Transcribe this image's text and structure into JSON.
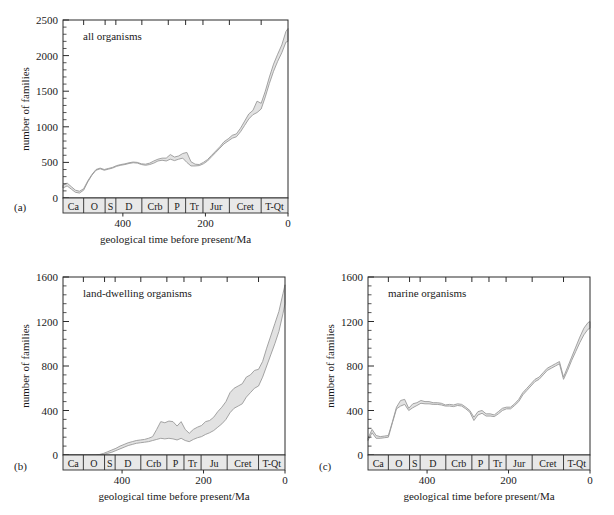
{
  "figure": {
    "axis_label_x": "geological time before present/Ma",
    "axis_label_y": "number of families",
    "panel_labels": {
      "a": "(a)",
      "b": "(b)",
      "c": "(c)"
    }
  },
  "chart_data": [
    {
      "id": "a",
      "type": "area",
      "title": "all organisms",
      "xlabel": "geological time before present/Ma",
      "ylabel": "number of families",
      "xlim": [
        545,
        0
      ],
      "ylim": [
        0,
        2500
      ],
      "xticks": [
        400,
        200,
        0
      ],
      "xtick_labels": [
        "400",
        "200",
        "0"
      ],
      "yticks": [
        0,
        500,
        1000,
        1500,
        2000,
        2500
      ],
      "ytick_labels": [
        "0",
        "500",
        "1000",
        "1500",
        "2000",
        "2500"
      ],
      "y_minor_step": 100,
      "grid": false,
      "legend": "none",
      "periods": [
        {
          "label": "Ca",
          "start": 545,
          "end": 495
        },
        {
          "label": "O",
          "start": 495,
          "end": 443
        },
        {
          "label": "S",
          "start": 443,
          "end": 417
        },
        {
          "label": "D",
          "start": 417,
          "end": 354
        },
        {
          "label": "Crb",
          "start": 354,
          "end": 290
        },
        {
          "label": "P",
          "start": 290,
          "end": 248
        },
        {
          "label": "Tr",
          "start": 248,
          "end": 206
        },
        {
          "label": "Jur",
          "start": 206,
          "end": 142
        },
        {
          "label": "Cret",
          "start": 142,
          "end": 65
        },
        {
          "label": "T-Qt",
          "start": 65,
          "end": 0
        }
      ],
      "x": [
        545,
        535,
        525,
        515,
        505,
        495,
        485,
        475,
        465,
        455,
        445,
        435,
        425,
        415,
        405,
        395,
        385,
        375,
        365,
        355,
        345,
        335,
        325,
        315,
        305,
        295,
        285,
        275,
        265,
        255,
        245,
        235,
        225,
        215,
        205,
        195,
        185,
        175,
        165,
        155,
        145,
        135,
        125,
        115,
        105,
        95,
        85,
        75,
        65,
        55,
        45,
        35,
        25,
        15,
        5,
        0
      ],
      "series": [
        {
          "name": "upper",
          "values": [
            180,
            210,
            160,
            110,
            95,
            130,
            240,
            330,
            400,
            420,
            400,
            415,
            430,
            455,
            470,
            480,
            495,
            505,
            500,
            480,
            475,
            490,
            520,
            545,
            560,
            560,
            610,
            575,
            590,
            625,
            640,
            510,
            475,
            470,
            500,
            540,
            600,
            660,
            720,
            790,
            830,
            880,
            900,
            980,
            1080,
            1180,
            1230,
            1360,
            1330,
            1500,
            1700,
            1880,
            2020,
            2150,
            2340,
            2380
          ]
        },
        {
          "name": "lower",
          "values": [
            140,
            170,
            125,
            80,
            70,
            110,
            225,
            320,
            390,
            410,
            390,
            405,
            420,
            445,
            460,
            470,
            485,
            495,
            490,
            470,
            460,
            470,
            490,
            520,
            530,
            520,
            545,
            525,
            545,
            560,
            500,
            450,
            450,
            455,
            480,
            520,
            580,
            640,
            700,
            760,
            800,
            840,
            860,
            930,
            1020,
            1110,
            1170,
            1200,
            1250,
            1420,
            1610,
            1780,
            1920,
            2040,
            2190,
            2200
          ]
        }
      ]
    },
    {
      "id": "b",
      "type": "area",
      "title": "land-dwelling organisms",
      "xlabel": "geological time before present/Ma",
      "ylabel": "number of families",
      "xlim": [
        545,
        0
      ],
      "ylim": [
        0,
        1600
      ],
      "xticks": [
        400,
        200,
        0
      ],
      "xtick_labels": [
        "400",
        "200",
        "0"
      ],
      "yticks": [
        0,
        400,
        800,
        1200,
        1600
      ],
      "ytick_labels": [
        "0",
        "400",
        "800",
        "1200",
        "1600"
      ],
      "y_minor_step": 80,
      "grid": false,
      "legend": "none",
      "periods": [
        {
          "label": "Ca",
          "start": 545,
          "end": 495
        },
        {
          "label": "O",
          "start": 495,
          "end": 443
        },
        {
          "label": "S",
          "start": 443,
          "end": 417
        },
        {
          "label": "D",
          "start": 417,
          "end": 354
        },
        {
          "label": "Crb",
          "start": 354,
          "end": 290
        },
        {
          "label": "P",
          "start": 290,
          "end": 248
        },
        {
          "label": "Tr",
          "start": 248,
          "end": 206
        },
        {
          "label": "Ju",
          "start": 206,
          "end": 142
        },
        {
          "label": "Cret",
          "start": 142,
          "end": 65
        },
        {
          "label": "T-Qt",
          "start": 65,
          "end": 0
        }
      ],
      "x": [
        545,
        535,
        525,
        515,
        505,
        495,
        485,
        475,
        465,
        455,
        445,
        435,
        425,
        415,
        405,
        395,
        385,
        375,
        365,
        355,
        345,
        335,
        325,
        315,
        305,
        295,
        285,
        275,
        265,
        255,
        245,
        235,
        225,
        215,
        205,
        195,
        185,
        175,
        165,
        155,
        145,
        135,
        125,
        115,
        105,
        95,
        85,
        75,
        65,
        55,
        45,
        35,
        25,
        15,
        5,
        0
      ],
      "series": [
        {
          "name": "upper",
          "values": [
            0,
            0,
            0,
            0,
            0,
            0,
            0,
            0,
            0,
            5,
            15,
            30,
            45,
            60,
            80,
            95,
            110,
            120,
            130,
            135,
            140,
            150,
            165,
            230,
            300,
            290,
            305,
            300,
            260,
            300,
            230,
            195,
            230,
            250,
            265,
            300,
            310,
            340,
            390,
            430,
            480,
            560,
            600,
            620,
            640,
            700,
            720,
            760,
            770,
            840,
            960,
            1070,
            1180,
            1290,
            1450,
            1530
          ]
        },
        {
          "name": "lower",
          "values": [
            0,
            0,
            0,
            0,
            0,
            0,
            0,
            0,
            0,
            0,
            5,
            15,
            25,
            40,
            55,
            70,
            85,
            95,
            105,
            110,
            115,
            120,
            130,
            140,
            150,
            145,
            150,
            145,
            135,
            150,
            130,
            120,
            140,
            155,
            165,
            185,
            200,
            220,
            250,
            280,
            320,
            380,
            420,
            440,
            460,
            520,
            560,
            600,
            620,
            700,
            800,
            900,
            1000,
            1110,
            1270,
            1360
          ]
        }
      ]
    },
    {
      "id": "c",
      "type": "area",
      "title": "marine organisms",
      "xlabel": "geological time before present/Ma",
      "ylabel": "number of families",
      "xlim": [
        545,
        0
      ],
      "ylim": [
        0,
        1600
      ],
      "xticks": [
        400,
        200,
        0
      ],
      "xtick_labels": [
        "400",
        "200",
        "0"
      ],
      "yticks": [
        0,
        400,
        800,
        1200,
        1600
      ],
      "ytick_labels": [
        "0",
        "400",
        "800",
        "1200",
        "1600"
      ],
      "y_minor_step": 80,
      "grid": false,
      "legend": "none",
      "periods": [
        {
          "label": "Ca",
          "start": 545,
          "end": 495
        },
        {
          "label": "O",
          "start": 495,
          "end": 443
        },
        {
          "label": "S",
          "start": 443,
          "end": 417
        },
        {
          "label": "D",
          "start": 417,
          "end": 354
        },
        {
          "label": "Crb",
          "start": 354,
          "end": 290
        },
        {
          "label": "P",
          "start": 290,
          "end": 248
        },
        {
          "label": "Tr",
          "start": 248,
          "end": 206
        },
        {
          "label": "Jur",
          "start": 206,
          "end": 142
        },
        {
          "label": "Cret",
          "start": 142,
          "end": 65
        },
        {
          "label": "T-Qt",
          "start": 65,
          "end": 0
        }
      ],
      "x": [
        545,
        535,
        525,
        515,
        505,
        495,
        485,
        475,
        465,
        455,
        445,
        435,
        425,
        415,
        405,
        395,
        385,
        375,
        365,
        355,
        345,
        335,
        325,
        315,
        305,
        295,
        285,
        275,
        265,
        255,
        245,
        235,
        225,
        215,
        205,
        195,
        185,
        175,
        165,
        155,
        145,
        135,
        125,
        115,
        105,
        95,
        85,
        75,
        65,
        55,
        45,
        35,
        25,
        15,
        5,
        0
      ],
      "series": [
        {
          "name": "upper",
          "values": [
            150,
            230,
            175,
            165,
            170,
            175,
            300,
            430,
            490,
            500,
            420,
            460,
            470,
            490,
            480,
            480,
            470,
            470,
            465,
            450,
            455,
            450,
            460,
            455,
            430,
            400,
            340,
            390,
            400,
            370,
            370,
            360,
            390,
            420,
            430,
            430,
            460,
            500,
            560,
            600,
            640,
            680,
            700,
            740,
            780,
            800,
            820,
            840,
            700,
            790,
            880,
            970,
            1060,
            1140,
            1190,
            1200
          ]
        },
        {
          "name": "lower",
          "values": [
            130,
            200,
            150,
            150,
            155,
            160,
            290,
            415,
            440,
            455,
            400,
            425,
            445,
            465,
            460,
            460,
            455,
            455,
            450,
            440,
            440,
            435,
            445,
            440,
            415,
            385,
            310,
            360,
            375,
            350,
            350,
            345,
            370,
            400,
            415,
            415,
            445,
            480,
            540,
            580,
            620,
            660,
            680,
            720,
            760,
            780,
            800,
            820,
            680,
            760,
            850,
            930,
            1010,
            1080,
            1130,
            1140
          ]
        }
      ]
    }
  ]
}
